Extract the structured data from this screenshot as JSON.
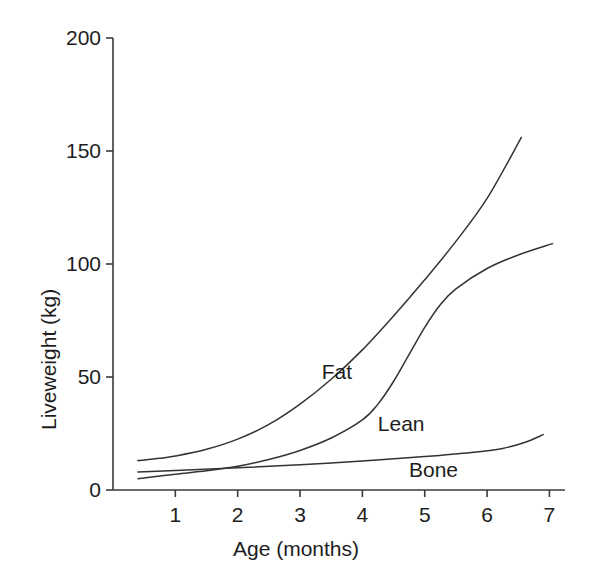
{
  "chart_data": {
    "type": "line",
    "title": "",
    "xlabel": "Age (months)",
    "ylabel": "Liveweight (kg)",
    "xlim": [
      0,
      7.25
    ],
    "ylim": [
      0,
      200
    ],
    "xticks": [
      1,
      2,
      3,
      4,
      5,
      6,
      7
    ],
    "yticks": [
      0,
      50,
      100,
      150,
      200
    ],
    "xtick_labels": [
      "1",
      "2",
      "3",
      "4",
      "5",
      "6",
      "7"
    ],
    "ytick_labels": [
      "0",
      "50",
      "100",
      "150",
      "200"
    ],
    "grid": false,
    "legend": "inline-curve-labels",
    "series": [
      {
        "name": "Fat",
        "label": "Fat",
        "color": "#333333",
        "x": [
          0.4,
          0.75,
          1.0,
          1.5,
          2.0,
          2.5,
          3.0,
          3.5,
          4.0,
          4.5,
          5.0,
          5.5,
          6.0,
          6.55
        ],
        "y": [
          13.0,
          14.0,
          15.0,
          18.0,
          22.5,
          29.0,
          38.0,
          49.0,
          62.0,
          77.0,
          93.0,
          110.0,
          129.0,
          156.0
        ]
      },
      {
        "name": "Lean",
        "label": "Lean",
        "color": "#333333",
        "x": [
          0.4,
          1.0,
          1.5,
          2.0,
          2.5,
          3.0,
          3.5,
          4.0,
          4.25,
          4.5,
          4.75,
          5.0,
          5.25,
          5.5,
          6.0,
          6.5,
          7.05
        ],
        "y": [
          5.0,
          7.0,
          8.5,
          10.5,
          13.5,
          17.5,
          23.0,
          31.0,
          38.0,
          48.0,
          60.0,
          72.0,
          82.0,
          89.0,
          98.0,
          104.0,
          109.0
        ]
      },
      {
        "name": "Bone",
        "label": "Bone",
        "color": "#333333",
        "x": [
          0.4,
          1.0,
          2.0,
          3.0,
          4.0,
          5.0,
          5.75,
          6.25,
          6.6,
          6.9
        ],
        "y": [
          8.0,
          8.6,
          9.8,
          11.2,
          12.8,
          14.8,
          16.6,
          18.4,
          21.0,
          24.5
        ]
      }
    ],
    "curve_labels": [
      {
        "text": "Fat",
        "x": 3.7,
        "y": 52
      },
      {
        "text": "Lean",
        "x": 4.6,
        "y": 29
      },
      {
        "text": "Bone",
        "x": 5.1,
        "y": 9
      }
    ]
  },
  "axis": {
    "x_title": "Age (months)",
    "y_title": "Liveweight (kg)"
  }
}
